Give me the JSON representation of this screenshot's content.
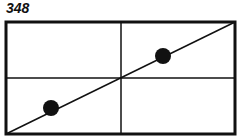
{
  "figure": {
    "number_label": "348",
    "stroke_color": "#111111",
    "background": "#ffffff"
  },
  "diagram": {
    "frame": {
      "x1": 6,
      "y1": 22,
      "x2": 235,
      "y2": 134
    },
    "grid": {
      "vertical_divider_x": 121,
      "horizontal_divider_y": 78
    },
    "diagonal_line": {
      "from": "bottom-left",
      "to": "top-right"
    },
    "points": [
      {
        "cx": 51,
        "cy": 108,
        "r": 8
      },
      {
        "cx": 163,
        "cy": 56,
        "r": 8
      }
    ]
  }
}
